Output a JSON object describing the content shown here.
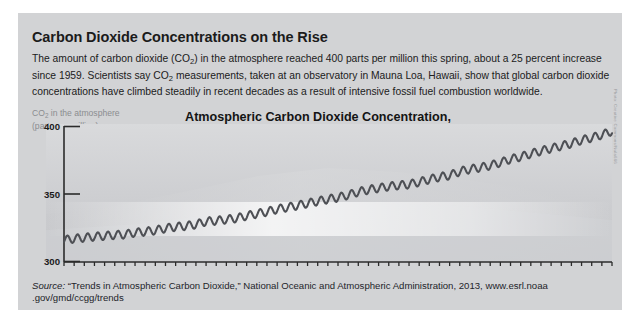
{
  "headline": "Carbon Dioxide Concentrations on the Rise",
  "deck": {
    "part1": "The amount of carbon dioxide (CO",
    "sub1": "2",
    "part2": ") in the atmosphere reached 400 parts per million this spring, about a 25 percent increase since 1959. Scientists say CO",
    "sub2": "2",
    "part3": " measurements, taken at an observatory in Mauna Loa, Hawaii, show that global carbon dioxide concentrations have climbed steadily in recent decades as a result of intensive fossil fuel combustion worldwide."
  },
  "y_axis_label": {
    "line1_a": "CO",
    "line1_sub": "2",
    "line1_b": " in the atmosphere",
    "line2": "(parts per million)"
  },
  "credit": "Photo: Creative Commons/Nula666",
  "source": {
    "label": "Source:",
    "text": " “Trends in Atmospheric Carbon Dioxide,” National Oceanic and Atmospheric Administration, 2013, www.esrl.noaa",
    "url_tail": ".gov/gmd/ccgg/trends"
  },
  "colors": {
    "panel": "#d2d3d5",
    "ink": "#1b1b1b",
    "axis": "#2b2b2b",
    "curve": "#4e5055",
    "muted": "#8b8d90"
  },
  "chart_data": {
    "type": "line",
    "title": "Atmospheric Carbon Dioxide Concentration, 1959-2013",
    "title_line1": "Atmospheric Carbon Dioxide Concentration,",
    "title_line2": "1959-2013",
    "xlabel": "",
    "ylabel": "CO2 in the atmosphere (parts per million)",
    "ylim": [
      300,
      400
    ],
    "yticks": [
      300,
      350,
      400
    ],
    "ytick_labels": [
      "300",
      "350",
      "400"
    ],
    "xlim": [
      1959,
      2013
    ],
    "grid": false,
    "legend": null,
    "annotation": "Seasonal sawtooth oscillation superimposed on rising trend (Keeling Curve)",
    "seasonal_amplitude": 3.0,
    "xtick_labels": [
      "1959",
      "'61",
      "'63",
      "'65",
      "'67",
      "'69",
      "'71",
      "'73",
      "'75",
      "'77",
      "'79",
      "'81",
      "'83",
      "'85",
      "'87",
      "'89",
      "'91",
      "'93",
      "'95",
      "'97",
      "'99",
      "2001",
      "'03",
      "'05",
      "'07",
      "'09",
      "2013"
    ],
    "xtick_values": [
      1959,
      1961,
      1963,
      1965,
      1967,
      1969,
      1971,
      1973,
      1975,
      1977,
      1979,
      1981,
      1983,
      1985,
      1987,
      1989,
      1991,
      1993,
      1995,
      1997,
      1999,
      2001,
      2003,
      2005,
      2007,
      2009,
      2013
    ],
    "x": [
      1959,
      1960,
      1961,
      1962,
      1963,
      1964,
      1965,
      1966,
      1967,
      1968,
      1969,
      1970,
      1971,
      1972,
      1973,
      1974,
      1975,
      1976,
      1977,
      1978,
      1979,
      1980,
      1981,
      1982,
      1983,
      1984,
      1985,
      1986,
      1987,
      1988,
      1989,
      1990,
      1991,
      1992,
      1993,
      1994,
      1995,
      1996,
      1997,
      1998,
      1999,
      2000,
      2001,
      2002,
      2003,
      2004,
      2005,
      2006,
      2007,
      2008,
      2009,
      2010,
      2011,
      2012,
      2013
    ],
    "values": [
      315.97,
      316.91,
      317.64,
      318.45,
      318.99,
      319.62,
      320.04,
      321.38,
      322.16,
      323.04,
      324.62,
      325.68,
      326.32,
      327.45,
      329.68,
      330.18,
      331.11,
      332.04,
      333.83,
      335.4,
      336.84,
      338.75,
      340.11,
      341.45,
      343.05,
      344.65,
      346.12,
      347.42,
      349.19,
      351.57,
      353.12,
      354.39,
      355.61,
      356.45,
      357.1,
      358.83,
      360.82,
      362.61,
      363.73,
      366.7,
      368.38,
      369.55,
      371.14,
      373.28,
      375.8,
      377.52,
      379.8,
      381.9,
      383.79,
      385.6,
      387.43,
      389.9,
      391.65,
      393.85,
      396.52
    ]
  }
}
